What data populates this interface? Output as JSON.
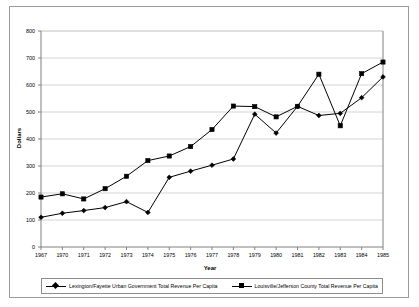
{
  "chart_data": {
    "type": "line",
    "title": "",
    "xlabel": "Year",
    "ylabel": "Dollars",
    "ylim": [
      0,
      800
    ],
    "ytick_step": 100,
    "yticks": [
      "0",
      "100",
      "200",
      "300",
      "400",
      "500",
      "600",
      "700",
      "800"
    ],
    "grid": true,
    "legend_position": "bottom",
    "categories": [
      "1967",
      "1970",
      "1971",
      "1972",
      "1973",
      "1974",
      "1975",
      "1976",
      "1977",
      "1978",
      "1979",
      "1980",
      "1981",
      "1982",
      "1983",
      "1984",
      "1985"
    ],
    "series": [
      {
        "name": "Lexington/Fayette Urban Government Total Revenue Per Capita",
        "marker": "diamond",
        "color": "#000000",
        "values": [
          110,
          125,
          135,
          146,
          168,
          128,
          258,
          281,
          303,
          326,
          492,
          422,
          521,
          487,
          495,
          553,
          630
        ]
      },
      {
        "name": "Louisville/Jefferson County Total Revenue Per Capita",
        "marker": "square",
        "color": "#000000",
        "values": [
          185,
          197,
          178,
          216,
          262,
          320,
          337,
          372,
          435,
          522,
          520,
          482,
          521,
          640,
          449,
          642,
          685
        ]
      }
    ]
  },
  "axes": {
    "x_title": "Year",
    "y_title": "Dollars"
  },
  "legend": {
    "entries": [
      {
        "label": "Lexington/Fayette Urban Government Total Revenue Per Capita",
        "marker": "diamond-marker"
      },
      {
        "label": "Louisville/Jefferson County Total Revenue Per Capita",
        "marker": "square-marker"
      }
    ]
  },
  "colors": {
    "line": "#000000",
    "grid": "#d4d4d4",
    "axis": "#808080",
    "frame": "#9a9a9a",
    "background": "#ffffff"
  }
}
